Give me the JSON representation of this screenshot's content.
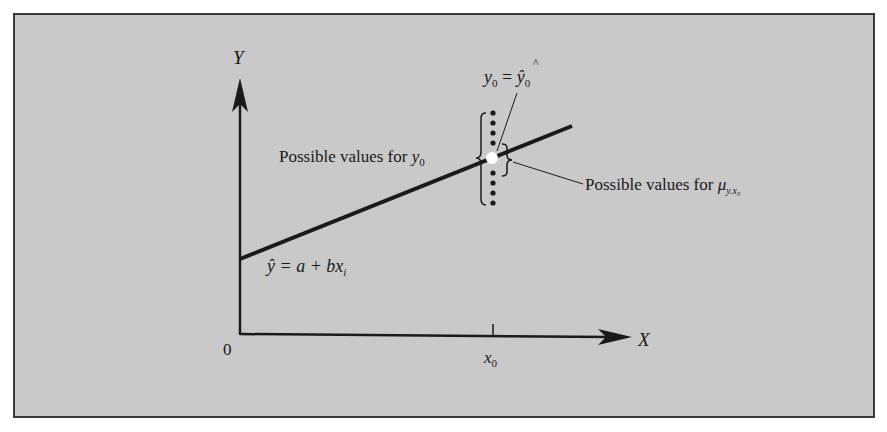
{
  "figure": {
    "axes": {
      "y_label": "Y",
      "x_label": "X",
      "origin_label": "0",
      "x_tick_label": "x",
      "x_tick_sub": "0"
    },
    "regression_line": {
      "label_yhat": "ŷ",
      "label_eq": " = a + bx",
      "label_sub": "i"
    },
    "point_label": {
      "lhs": "y",
      "lhs_sub": "0",
      "eq": " = ",
      "rhs": "ŷ",
      "rhs_sub": "0"
    },
    "annotation_left": {
      "text": "Possible values for ",
      "var": "y",
      "var_sub": "0"
    },
    "annotation_right": {
      "text": "Possible values for ",
      "var": "μ",
      "var_sub": "y.x₀"
    },
    "colors": {
      "background": "#c9c9c9",
      "border": "#3a3a3a",
      "ink": "#1a1a1a",
      "point": "#ffffff"
    }
  }
}
